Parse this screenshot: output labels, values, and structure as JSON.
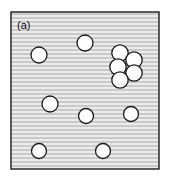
{
  "figure": {
    "panel_label": "(a)",
    "caption_position": "top-left-inside",
    "background_color": "#ffffff",
    "frame": {
      "x": 11,
      "y": 12,
      "width": 148,
      "height": 157,
      "stroke_color": "#1a1a1a",
      "stroke_width": 1.4,
      "fill_color": "#e9e9e9",
      "texture": "zigzag-wave-hatch",
      "texture_color": "#b6b6b6"
    },
    "particle_style": {
      "fill_color": "#ffffff",
      "stroke_color": "#1a1a1a",
      "stroke_width": 1.3
    },
    "particles": [
      {
        "id": "p1",
        "cx": 39,
        "cy": 55,
        "r": 8.0,
        "group": "dispersed"
      },
      {
        "id": "p2",
        "cx": 85,
        "cy": 43,
        "r": 8.0,
        "group": "dispersed"
      },
      {
        "id": "p3",
        "cx": 50,
        "cy": 104,
        "r": 8.0,
        "group": "dispersed"
      },
      {
        "id": "p4",
        "cx": 86,
        "cy": 116,
        "r": 7.5,
        "group": "dispersed"
      },
      {
        "id": "p5",
        "cx": 131,
        "cy": 114,
        "r": 7.5,
        "group": "dispersed"
      },
      {
        "id": "p6",
        "cx": 39,
        "cy": 151,
        "r": 7.5,
        "group": "dispersed"
      },
      {
        "id": "p7",
        "cx": 103,
        "cy": 151,
        "r": 7.5,
        "group": "dispersed"
      },
      {
        "id": "c1",
        "cx": 120,
        "cy": 53,
        "r": 8.2,
        "group": "cluster"
      },
      {
        "id": "c2",
        "cx": 134,
        "cy": 60,
        "r": 8.2,
        "group": "cluster"
      },
      {
        "id": "c3",
        "cx": 118,
        "cy": 67,
        "r": 8.2,
        "group": "cluster"
      },
      {
        "id": "c4",
        "cx": 134,
        "cy": 73,
        "r": 8.2,
        "group": "cluster"
      },
      {
        "id": "c5",
        "cx": 120,
        "cy": 80,
        "r": 8.2,
        "group": "cluster"
      }
    ],
    "counts": {
      "dispersed": 7,
      "clustered": 5,
      "total": 12
    }
  }
}
